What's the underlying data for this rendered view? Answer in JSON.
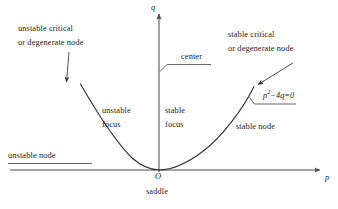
{
  "figure": {
    "background_color": "#ffffff",
    "line_color": "#4d4d4d",
    "curve_color": "#333333",
    "text_color": "#1a1a1a"
  },
  "axes": {
    "x_label": "p",
    "y_label": "q",
    "origin_label": "O",
    "x_axis_y": 170,
    "y_axis_x": 159,
    "x_range_px": [
      10,
      322
    ],
    "y_range_px": [
      12,
      172
    ]
  },
  "curve": {
    "equation_label": "p²−4q=0",
    "equation_base": "p",
    "equation_exponent": "2",
    "equation_tail": "−4q=0",
    "type": "parabola",
    "vertex_px": [
      159,
      170
    ],
    "description": "discriminant parabola p squared minus 4q equals zero"
  },
  "regions": [
    {
      "id": "unstable-node",
      "label": "unstable node",
      "x": 8,
      "y": 151
    },
    {
      "id": "unstable-focus",
      "line1": "unstable",
      "line2": "focus",
      "x": 102,
      "y": 104
    },
    {
      "id": "stable-focus",
      "line1": "stable",
      "line2": "focus",
      "x": 165,
      "y": 104
    },
    {
      "id": "stable-node",
      "label": "stable node",
      "x": 236,
      "y": 122
    },
    {
      "id": "saddle",
      "label": "saddle",
      "x": 146,
      "y": 187
    },
    {
      "id": "center",
      "label": "center",
      "x": 181,
      "y": 52
    }
  ],
  "annotations": [
    {
      "id": "unstable-critical",
      "line1": "unstable critical",
      "line2": "or degenerate node",
      "x": 18,
      "y": 22,
      "arrow": {
        "x1": 69,
        "y1": 52,
        "x2": 66,
        "y2": 84
      }
    },
    {
      "id": "stable-critical",
      "line1": "stable critical",
      "line2": "or degenerate node",
      "x": 228,
      "y": 28,
      "arrow": {
        "x1": 292,
        "y1": 64,
        "x2": 256,
        "y2": 86
      }
    }
  ]
}
